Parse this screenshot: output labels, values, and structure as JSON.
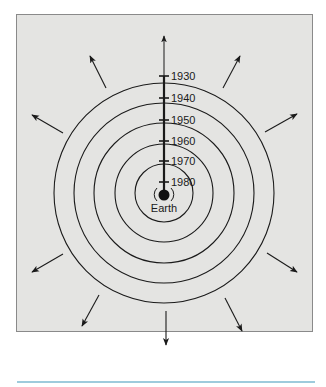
{
  "figure": {
    "center_label": "Earth",
    "year_labels": [
      "1930",
      "1940",
      "1950",
      "1960",
      "1970",
      "1980"
    ],
    "colors": {
      "panel_background": "#e4e4e2",
      "line": "#1a1a1a",
      "bottom_rule": "#9ecbdc"
    },
    "rings": [
      {
        "year": "1930",
        "radius": 117
      },
      {
        "year": "1940",
        "radius": 95
      },
      {
        "year": "1950",
        "radius": 73
      },
      {
        "year": "1960",
        "radius": 52
      },
      {
        "year": "1970",
        "radius": 32
      },
      {
        "year": "1980",
        "radius": 12
      }
    ],
    "arrow_directions": [
      "up",
      "upper-right",
      "right-up",
      "right-down",
      "lower-right",
      "down",
      "lower-left",
      "left-down",
      "left-up",
      "upper-left"
    ]
  }
}
